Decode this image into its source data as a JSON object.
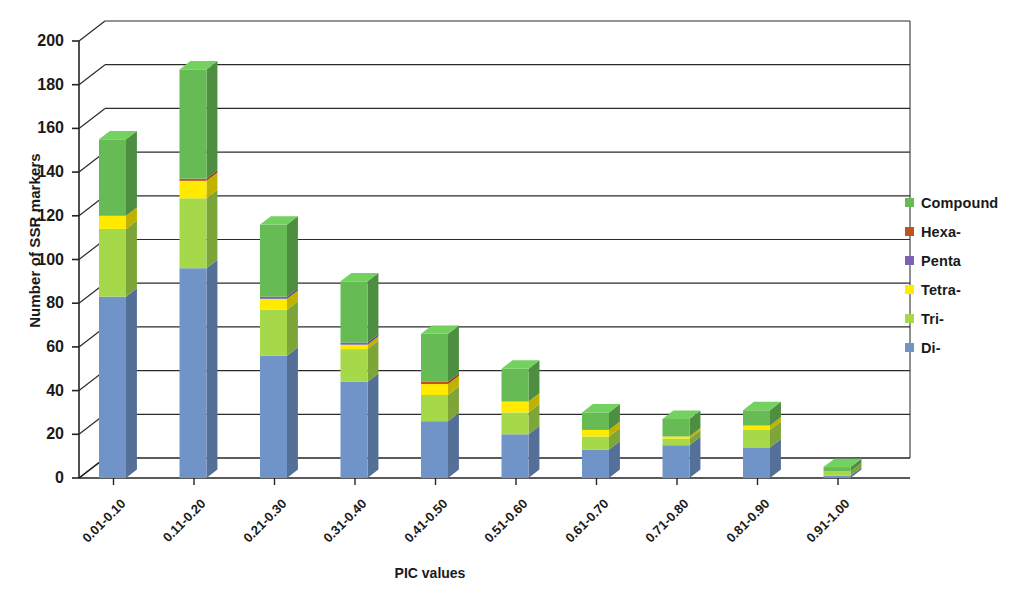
{
  "chart_data": {
    "type": "bar",
    "subtype": "stacked-bar-3d",
    "title": "",
    "xlabel": "PIC values",
    "ylabel": "Number of SSR markers",
    "ylim": [
      0,
      200
    ],
    "yticks": [
      0,
      20,
      40,
      60,
      80,
      100,
      120,
      140,
      160,
      180,
      200
    ],
    "grid": true,
    "legend_position": "right",
    "categories": [
      "0.01-0.10",
      "0.11-0.20",
      "0.21-0.30",
      "0.31-0.40",
      "0.41-0.50",
      "0.51-0.60",
      "0.61-0.70",
      "0.71-0.80",
      "0.81-0.90",
      "0.91-1.00"
    ],
    "series": [
      {
        "name": "Di-",
        "color": "#7093c8",
        "values": [
          83,
          96,
          56,
          44,
          26,
          20,
          13,
          15,
          14,
          1
        ]
      },
      {
        "name": "Tri-",
        "color": "#a5d94a",
        "values": [
          31,
          32,
          21,
          15,
          12,
          10,
          6,
          3,
          8,
          2
        ]
      },
      {
        "name": "Tetra-",
        "color": "#ffea00",
        "values": [
          6,
          8,
          5,
          2,
          5,
          5,
          3,
          1,
          2,
          0
        ]
      },
      {
        "name": "Penta",
        "color": "#7a62b4",
        "values": [
          0,
          0,
          1,
          1,
          0,
          0,
          0,
          0,
          0,
          0
        ]
      },
      {
        "name": "Hexa-",
        "color": "#c0521f",
        "values": [
          0,
          1,
          0,
          0,
          1,
          0,
          0,
          0,
          0,
          0
        ]
      },
      {
        "name": "Compound",
        "color": "#66bb55",
        "values": [
          35,
          50,
          33,
          28,
          22,
          15,
          8,
          8,
          7,
          2
        ]
      }
    ],
    "totals": [
      155,
      187,
      116,
      90,
      66,
      50,
      30,
      27,
      31,
      5
    ],
    "legend_order": [
      "Compound",
      "Hexa-",
      "Penta",
      "Tetra-",
      "Tri-",
      "Di-"
    ]
  },
  "legend": {
    "items": [
      {
        "label": "Compound",
        "color": "#66bb55"
      },
      {
        "label": "Hexa-",
        "color": "#c0521f"
      },
      {
        "label": "Penta",
        "color": "#7a62b4"
      },
      {
        "label": "Tetra-",
        "color": "#ffea00"
      },
      {
        "label": "Tri-",
        "color": "#a5d94a"
      },
      {
        "label": "Di-",
        "color": "#7093c8"
      }
    ]
  },
  "axes": {
    "y_title": "Number of SSR markers",
    "x_title": "PIC values",
    "y_tick_labels": [
      "200",
      "180",
      "160",
      "140",
      "120",
      "100",
      "80",
      "60",
      "40",
      "20",
      "0"
    ]
  },
  "colors": {
    "axis_line": "#232323",
    "gridline": "#2b2b2b",
    "background": "#ffffff",
    "text": "#1a1a1a"
  }
}
